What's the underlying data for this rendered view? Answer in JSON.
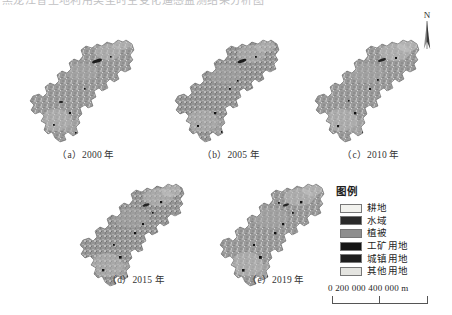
{
  "figure": {
    "clipped_top_text": "黑龙江省土地利用类型时空变化遥感监测结果分析图",
    "north_arrow": {
      "label": "N",
      "icon": "north-arrow-icon"
    },
    "panels": [
      {
        "id": "a",
        "caption": "（a）2000 年",
        "year": "2000"
      },
      {
        "id": "b",
        "caption": "（b）2005 年",
        "year": "2005"
      },
      {
        "id": "c",
        "caption": "（c）2010 年",
        "year": "2010"
      },
      {
        "id": "d",
        "caption": "（d）2015 年",
        "year": "2015"
      },
      {
        "id": "e",
        "caption": "（e）2019 年",
        "year": "2019"
      }
    ],
    "legend": {
      "title": "图例",
      "items": [
        {
          "label": "耕地",
          "color": "#f2f2ee"
        },
        {
          "label": "水域",
          "color": "#2a2a2a"
        },
        {
          "label": "植被",
          "color": "#8e8e8e"
        },
        {
          "label": "工矿用地",
          "color": "#141414"
        },
        {
          "label": "城镇用地",
          "color": "#1d1d1d"
        },
        {
          "label": "其他用地",
          "color": "#e4e4e0"
        }
      ]
    },
    "scale_bar": {
      "text": "0  200 000  400 000 m",
      "ticks": [
        "0",
        "200 000",
        "400 000"
      ],
      "unit": "m"
    }
  }
}
